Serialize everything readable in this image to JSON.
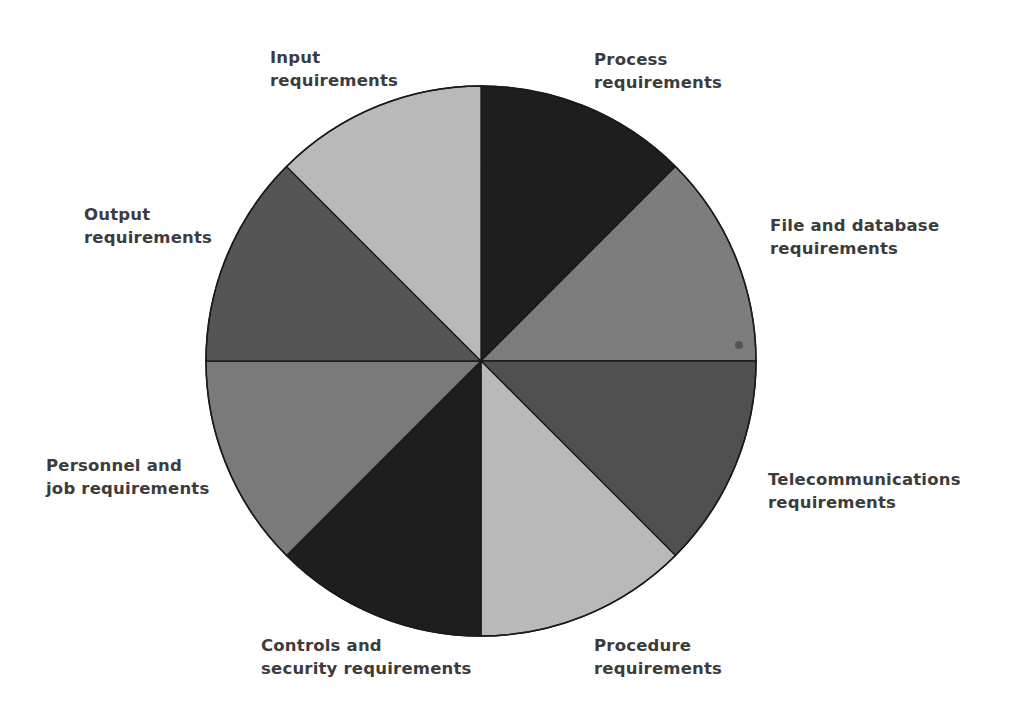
{
  "diagram": {
    "type": "segmented-circle",
    "center": {
      "x": 481,
      "y": 361
    },
    "radius": 275,
    "outline_color": "#1a1a1a",
    "artifact_dot": {
      "x": 739,
      "y": 345,
      "r": 4,
      "color": "#555555"
    },
    "segments": [
      {
        "name": "Process requirements",
        "start_deg": 0,
        "end_deg": 45,
        "color": "#1e1e1e",
        "label_lines": [
          "Process",
          "requirements"
        ],
        "label_pos": {
          "x": 594,
          "y": 48
        }
      },
      {
        "name": "File and database requirements",
        "start_deg": 45,
        "end_deg": 90,
        "color": "#7d7d7d",
        "label_lines": [
          "File and database",
          "requirements"
        ],
        "label_pos": {
          "x": 770,
          "y": 214
        }
      },
      {
        "name": "Telecommunications requirements",
        "start_deg": 90,
        "end_deg": 135,
        "color": "#505050",
        "label_lines": [
          "Telecommunications",
          "requirements"
        ],
        "label_pos": {
          "x": 768,
          "y": 468
        }
      },
      {
        "name": "Procedure requirements",
        "start_deg": 135,
        "end_deg": 180,
        "color": "#b9b9b9",
        "label_lines": [
          "Procedure",
          "requirements"
        ],
        "label_pos": {
          "x": 594,
          "y": 634
        }
      },
      {
        "name": "Controls and security requirements",
        "start_deg": 180,
        "end_deg": 225,
        "color": "#1e1e1e",
        "label_lines": [
          "Controls and",
          "security requirements"
        ],
        "label_pos": {
          "x": 261,
          "y": 634
        }
      },
      {
        "name": "Personnel and job requirements",
        "start_deg": 225,
        "end_deg": 270,
        "color": "#7a7a7a",
        "label_lines": [
          "Personnel and",
          "job requirements"
        ],
        "label_pos": {
          "x": 46,
          "y": 454
        }
      },
      {
        "name": "Output requirements",
        "start_deg": 270,
        "end_deg": 315,
        "color": "#555555",
        "label_lines": [
          "Output",
          "requirements"
        ],
        "label_pos": {
          "x": 84,
          "y": 203
        }
      },
      {
        "name": "Input requirements",
        "start_deg": 315,
        "end_deg": 360,
        "color": "#b9b9b9",
        "label_lines": [
          "Input",
          "requirements"
        ],
        "label_pos": {
          "x": 270,
          "y": 46
        }
      }
    ]
  },
  "labels": {
    "process": {
      "line1": "Process",
      "line2": "requirements"
    },
    "file_db": {
      "line1": "File and database",
      "line2": "requirements"
    },
    "telecom": {
      "line1": "Telecommunications",
      "line2": "requirements"
    },
    "procedure": {
      "line1": "Procedure",
      "line2": "requirements"
    },
    "controls": {
      "line1": "Controls and",
      "line2": "security requirements"
    },
    "personnel": {
      "line1": "Personnel and",
      "line2": "job requirements"
    },
    "output": {
      "line1": "Output",
      "line2": "requirements"
    },
    "input": {
      "line1": "Input",
      "line2": "requirements"
    }
  }
}
